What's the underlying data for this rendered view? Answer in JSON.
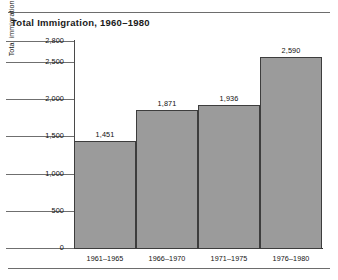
{
  "chart_data": {
    "type": "bar",
    "title": "Total Immigration, 1960–1980",
    "xlabel": "",
    "ylabel": "Total immigration during five-year periods (in thousands)",
    "categories": [
      "1961–1965",
      "1966–1970",
      "1971–1975",
      "1976–1980"
    ],
    "values": [
      1451,
      1871,
      1936,
      2590
    ],
    "value_labels": [
      "1,451",
      "1,871",
      "1,936",
      "2,590"
    ],
    "ytick_values": [
      2800,
      2500,
      2000,
      1500,
      1000,
      500,
      0
    ],
    "ytick_labels": [
      "2,800",
      "2,500",
      "2,000",
      "1,500",
      "1,000",
      "500",
      "0"
    ],
    "ylim": [
      0,
      2800
    ],
    "grid": false,
    "legend": false,
    "legend_position": "none",
    "bar_color": "#9b9b9b",
    "bar_edge_color": "#3d3d3d",
    "axis_color": "#2b2b2b",
    "background_color": "#ffffff",
    "note": "Y tick spacing is non-linear between 2,500 and 2,800 as drawn."
  }
}
